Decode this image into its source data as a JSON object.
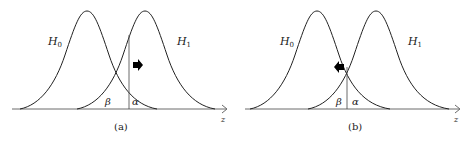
{
  "panels": [
    {
      "caption": "(a)",
      "h0_label": "H",
      "h0_sub": "0",
      "h1_label": "H",
      "h1_sub": "1",
      "beta_label": "β",
      "alpha_label": "α",
      "axis_label": "z",
      "arrow_direction": "right"
    },
    {
      "caption": "(b)",
      "h0_label": "H",
      "h0_sub": "0",
      "h1_label": "H",
      "h1_sub": "1",
      "beta_label": "β",
      "alpha_label": "α",
      "axis_label": "z",
      "arrow_direction": "left"
    }
  ]
}
